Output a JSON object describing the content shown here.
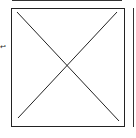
{
  "diagram": {
    "placeholder_box": {
      "label": "",
      "shape": "crossed-rectangle"
    },
    "side_glyph": "↩"
  }
}
